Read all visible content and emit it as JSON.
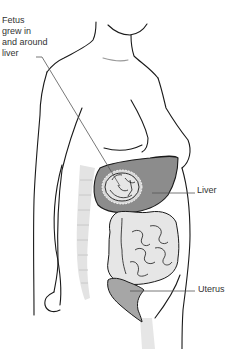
{
  "diagram": {
    "type": "anatomical-illustration",
    "labels": {
      "fetus": {
        "lines": [
          "Fetus",
          "grew in",
          "and around",
          "liver"
        ]
      },
      "liver": "Liver",
      "uterus": "Uterus"
    },
    "colors": {
      "outline": "#1a1a1a",
      "liver_fill": "#8c8c8c",
      "fetus_sac_fill": "#d9d9d9",
      "intestine_fill": "#e6e6e6",
      "uterus_fill": "#a6a6a6",
      "spine_fill": "#e3e3e3",
      "leader_line": "#555555",
      "label_text": "#333333"
    }
  }
}
